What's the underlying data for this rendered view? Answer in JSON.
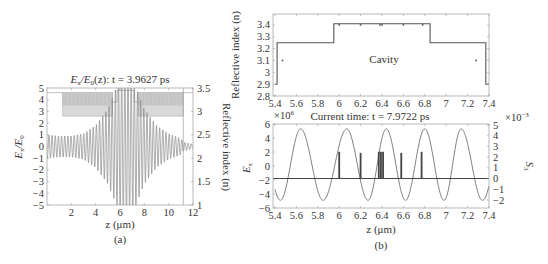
{
  "chart_data": [
    {
      "id": "a",
      "type": "line",
      "panel_label": "(a)",
      "title": "E_x/E_0(z): t = 3.9627 ps",
      "xlabel": "z (μm)",
      "ylabel": "E_x/E_0",
      "ylabel_right": "Reflective index (n)",
      "xlim": [
        0,
        12
      ],
      "ylim": [
        -5,
        5
      ],
      "ylim_right": [
        1,
        3.5
      ],
      "xticks": [
        2,
        4,
        6,
        8,
        10,
        12
      ],
      "yticks": [
        -5,
        -4,
        -3,
        -2,
        -1,
        0,
        1,
        2,
        3,
        4,
        5
      ],
      "yticks_right": [
        1,
        1.5,
        2,
        2.5,
        3,
        3.5
      ],
      "grid": false,
      "series": [
        {
          "name": "E_x/E_0 envelope (standing wave)",
          "description": "oscillating field, amplitude ~1 at edges growing to >5 at cavity center z≈6.4",
          "envelope_x": [
            0,
            1,
            2,
            3,
            4,
            5,
            5.5,
            6,
            6.4,
            7,
            7.5,
            8,
            9,
            10,
            11,
            11.2,
            12
          ],
          "envelope_amp": [
            1.0,
            0.9,
            0.9,
            1.1,
            1.8,
            3.2,
            4.5,
            6,
            6.5,
            6,
            4.5,
            3.2,
            1.8,
            1.1,
            0.7,
            0.4,
            0.2
          ]
        },
        {
          "name": "Reflective index (n)",
          "description": "Bragg mirrors (shaded) between n≈2.9 and 3.4 on both sides of a cavity",
          "mirror_left": [
            1.3,
            5.4
          ],
          "mirror_right": [
            7.5,
            11.2
          ],
          "n_low": 2.9,
          "n_high": 3.4,
          "cavity": [
            5.4,
            7.5
          ],
          "cavity_n": 3.3
        }
      ]
    },
    {
      "id": "b_top",
      "type": "line",
      "title": "",
      "xlabel": "",
      "ylabel": "Reflective index (n)",
      "xlim": [
        5.4,
        7.4
      ],
      "ylim": [
        2.8,
        3.5
      ],
      "xticks": [
        5.4,
        5.6,
        5.8,
        6,
        6.2,
        6.4,
        6.6,
        6.8,
        7,
        7.2,
        7.4
      ],
      "yticks": [
        2.8,
        2.9,
        3,
        3.1,
        3.2,
        3.3,
        3.4
      ],
      "annotation": "Cavity",
      "series": [
        {
          "name": "n(z)",
          "x": [
            5.4,
            5.42,
            5.42,
            5.95,
            5.95,
            6.85,
            6.85,
            7.37,
            7.37,
            7.4
          ],
          "y": [
            2.9,
            2.9,
            3.25,
            3.25,
            3.41,
            3.41,
            3.25,
            3.25,
            2.9,
            2.9
          ]
        },
        {
          "name": "markers",
          "x": [
            5.47,
            6.0,
            6.2,
            6.38,
            6.4,
            6.6,
            6.78,
            7.28
          ],
          "y": [
            3.1,
            3.4,
            3.4,
            3.4,
            3.4,
            3.4,
            3.4,
            3.1
          ]
        }
      ]
    },
    {
      "id": "b_bottom",
      "type": "line",
      "panel_label": "(b)",
      "title": "Current time: t = 7.9722 ps",
      "xlabel": "z (μm)",
      "ylabel": "E_x",
      "ylabel_right": "S_3",
      "y_multiplier": "×10^6",
      "y_multiplier_right": "×10^-3",
      "xlim": [
        5.4,
        7.4
      ],
      "ylim": [
        -6,
        6
      ],
      "ylim_right": [
        -2,
        5
      ],
      "xticks": [
        5.4,
        5.6,
        5.8,
        6,
        6.2,
        6.4,
        6.6,
        6.8,
        7,
        7.2,
        7.4
      ],
      "yticks": [
        -6,
        -4,
        -2,
        0,
        2,
        4,
        6
      ],
      "yticks_right": [
        -2,
        -1,
        0,
        1,
        2,
        3,
        4,
        5
      ],
      "series": [
        {
          "name": "E_x (×10^6)",
          "type": "line",
          "amplitude": 5.1,
          "peaks_x": [
            5.64,
            6.07,
            6.44,
            6.8,
            7.14
          ],
          "troughs_x": [
            5.45,
            5.85,
            6.27,
            6.62,
            6.98,
            7.34
          ]
        },
        {
          "name": "S_3 (×10^-3)",
          "type": "bar",
          "x": [
            6.0,
            6.2,
            6.37,
            6.39,
            6.41,
            6.58,
            6.77
          ],
          "values": [
            2.5,
            2.4,
            2.5,
            2.5,
            2.5,
            2.4,
            2.5
          ],
          "baseline": 0
        }
      ]
    }
  ],
  "labels": {
    "a_title": "E",
    "a_title_sub": "x",
    "a_title_mid": "/E",
    "a_title_sub2": "0",
    "a_title_rest": "(z): t = 3.9627 ps",
    "a_xlabel": "z (μm)",
    "a_panel": "(a)",
    "a_ylabel_right": "Reflective index (n)",
    "b_top_ylabel": "Reflective index (n)",
    "b_cavity": "Cavity",
    "b_title": "Current time: t = 7.9722 ps",
    "b_mult_left": "×10",
    "b_mult_left_exp": "6",
    "b_mult_right": "×10",
    "b_mult_right_exp": "−3",
    "b_xlabel": "z (μm)",
    "b_panel": "(b)"
  },
  "colors": {
    "axis": "#9a9a9a",
    "wave": "#8a8a8a",
    "wave_b": "#6e6e6e",
    "mirror_fill": "#d8d8d8",
    "mirror_line": "#9e9e9e",
    "bar": "#444444",
    "step": "#555555",
    "text": "#333333"
  }
}
